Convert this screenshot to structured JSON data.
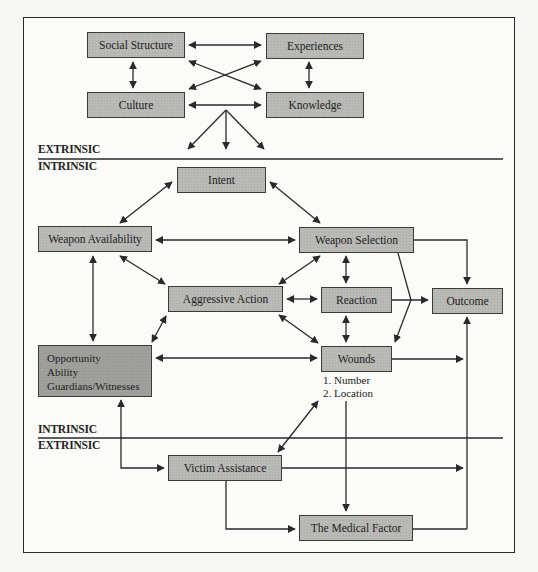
{
  "diagram": {
    "sections": {
      "top_extrinsic_label": "EXTRINSIC",
      "top_intrinsic_label": "INTRINSIC",
      "bottom_intrinsic_label": "INTRINSIC",
      "bottom_extrinsic_label": "EXTRINSIC"
    },
    "nodes": {
      "social_structure": "Social Structure",
      "experiences": "Experiences",
      "culture": "Culture",
      "knowledge": "Knowledge",
      "intent": "Intent",
      "weapon_availability": "Weapon Availability",
      "weapon_selection": "Weapon Selection",
      "aggressive_action": "Aggressive Action",
      "reaction": "Reaction",
      "outcome": "Outcome",
      "opportunity": [
        "Opportunity",
        "Ability",
        "Guardians/Witnesses"
      ],
      "wounds": "Wounds",
      "wounds_details": [
        "1. Number",
        "2. Location"
      ],
      "victim_assistance": "Victim Assistance",
      "medical_factor": "The Medical Factor"
    },
    "edges": [
      {
        "from": "Social Structure",
        "to": "Experiences",
        "type": "bidirectional"
      },
      {
        "from": "Social Structure",
        "to": "Culture",
        "type": "bidirectional"
      },
      {
        "from": "Experiences",
        "to": "Knowledge",
        "type": "bidirectional"
      },
      {
        "from": "Social Structure",
        "to": "Knowledge",
        "type": "bidirectional"
      },
      {
        "from": "Experiences",
        "to": "Culture",
        "type": "bidirectional"
      },
      {
        "from": "Culture",
        "to": "Knowledge",
        "type": "bidirectional"
      },
      {
        "from": "Extrinsic factors",
        "to": "Intrinsic factors",
        "type": "fan-out"
      },
      {
        "from": "Intent",
        "to": "Weapon Availability",
        "type": "bidirectional"
      },
      {
        "from": "Intent",
        "to": "Weapon Selection",
        "type": "bidirectional"
      },
      {
        "from": "Weapon Availability",
        "to": "Weapon Selection",
        "type": "bidirectional"
      },
      {
        "from": "Weapon Availability",
        "to": "Aggressive Action",
        "type": "bidirectional"
      },
      {
        "from": "Weapon Availability",
        "to": "Opportunity",
        "type": "bidirectional"
      },
      {
        "from": "Weapon Selection",
        "to": "Aggressive Action",
        "type": "bidirectional"
      },
      {
        "from": "Weapon Selection",
        "to": "Reaction",
        "type": "bidirectional"
      },
      {
        "from": "Weapon Selection",
        "to": "Outcome",
        "type": "directed"
      },
      {
        "from": "Weapon Selection",
        "to": "Wounds",
        "type": "directed"
      },
      {
        "from": "Aggressive Action",
        "to": "Reaction",
        "type": "bidirectional"
      },
      {
        "from": "Aggressive Action",
        "to": "Wounds",
        "type": "bidirectional"
      },
      {
        "from": "Aggressive Action",
        "to": "Opportunity",
        "type": "bidirectional"
      },
      {
        "from": "Reaction",
        "to": "Outcome",
        "type": "directed"
      },
      {
        "from": "Reaction",
        "to": "Wounds",
        "type": "bidirectional"
      },
      {
        "from": "Opportunity",
        "to": "Wounds",
        "type": "bidirectional"
      },
      {
        "from": "Wounds",
        "to": "Outcome",
        "type": "directed"
      },
      {
        "from": "Wounds",
        "to": "Victim Assistance",
        "type": "bidirectional"
      },
      {
        "from": "Wounds",
        "to": "The Medical Factor",
        "type": "directed"
      },
      {
        "from": "Opportunity",
        "to": "Victim Assistance",
        "type": "bidirectional"
      },
      {
        "from": "Victim Assistance",
        "to": "Outcome",
        "type": "directed"
      },
      {
        "from": "Victim Assistance",
        "to": "The Medical Factor",
        "type": "directed"
      },
      {
        "from": "The Medical Factor",
        "to": "Outcome",
        "type": "directed"
      }
    ]
  }
}
